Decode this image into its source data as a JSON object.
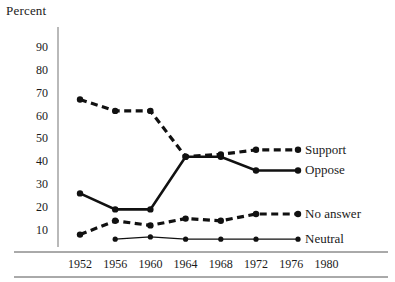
{
  "chart_data": {
    "type": "line",
    "title": "",
    "xlabel": "",
    "ylabel": "Percent",
    "categories": [
      1952,
      1956,
      1960,
      1964,
      1968,
      1972,
      1976,
      1980
    ],
    "x_tick_labels": [
      "1952",
      "1956",
      "1960",
      "1964",
      "1968",
      "1972",
      "1976",
      "1980"
    ],
    "y_tick_labels": [
      "90",
      "80",
      "70",
      "60",
      "50",
      "40",
      "30",
      "20",
      "10"
    ],
    "y_ticks": [
      90,
      80,
      70,
      60,
      50,
      40,
      30,
      20,
      10
    ],
    "ylim": [
      0,
      95
    ],
    "xlim": [
      1950,
      1982
    ],
    "grid": false,
    "legend_position": "right-inline",
    "series": [
      {
        "name": "Support",
        "style": "dashed-thick",
        "x": [
          1952,
          1956,
          1960,
          1964,
          1968,
          1972
        ],
        "values": [
          67,
          62,
          62,
          42,
          43,
          45
        ]
      },
      {
        "name": "Oppose",
        "style": "solid-thick",
        "x": [
          1952,
          1956,
          1960,
          1964,
          1968,
          1972
        ],
        "values": [
          26,
          19,
          19,
          42,
          42,
          36
        ]
      },
      {
        "name": "No answer",
        "style": "dashed-thick",
        "x": [
          1952,
          1956,
          1960,
          1964,
          1968,
          1972
        ],
        "values": [
          8,
          14,
          12,
          15,
          14,
          17
        ]
      },
      {
        "name": "Neutral",
        "style": "solid-thin",
        "x": [
          1956,
          1960,
          1964,
          1968,
          1972
        ],
        "values": [
          6,
          7,
          6,
          6,
          6
        ]
      }
    ]
  },
  "axis": {
    "y_title": "Percent"
  },
  "legend": {
    "support": "Support",
    "oppose": "Oppose",
    "no_answer": "No answer",
    "neutral": "Neutral"
  },
  "colors": {
    "ink": "#111111",
    "axis": "#8a8a8a",
    "background": "#ffffff"
  }
}
